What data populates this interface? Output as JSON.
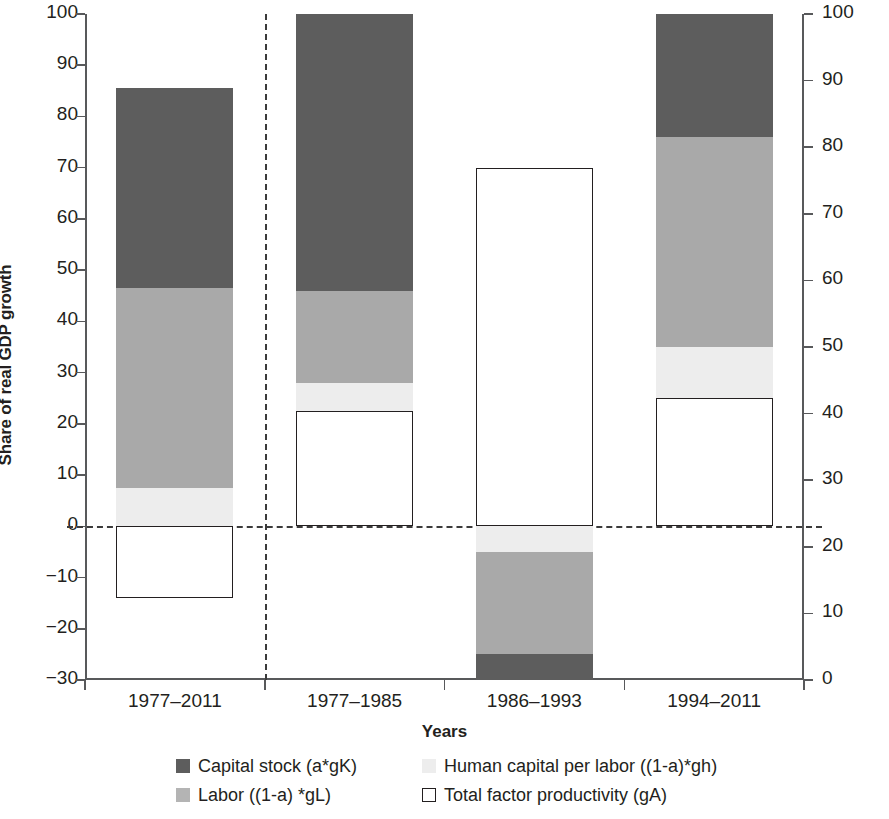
{
  "chart_data": {
    "type": "bar",
    "subtype": "stacked-bar-with-negatives",
    "title": "",
    "xlabel": "Years",
    "ylabel": "Share of real GDP growth",
    "categories": [
      "1977–2011",
      "1977–1985",
      "1986–1993",
      "1994–2011"
    ],
    "series": [
      {
        "name": "Capital stock (a*gK)",
        "color": "#5d5d5d",
        "values": [
          39,
          54,
          -5,
          24
        ]
      },
      {
        "name": "Labor ((1-a) *gL)",
        "color": "#a9a9a9",
        "values": [
          39,
          18,
          -20,
          41
        ]
      },
      {
        "name": "Human capital per labor ((1-a)*gh)",
        "color": "#ededed",
        "values": [
          7.5,
          5.5,
          -5,
          10
        ]
      },
      {
        "name": "Total factor productivity (gA)",
        "color": "#ffffff",
        "values": [
          -14,
          22.5,
          70,
          25
        ]
      }
    ],
    "bar_tops": [
      85.5,
      100,
      70,
      100
    ],
    "ylim": [
      -30,
      100
    ],
    "yticks": [
      -30,
      -20,
      -10,
      0,
      10,
      20,
      30,
      40,
      50,
      60,
      70,
      80,
      90,
      100
    ],
    "ytick_labels": [
      "−30",
      "−20",
      "−10",
      "0",
      "10",
      "20",
      "30",
      "40",
      "50",
      "60",
      "70",
      "80",
      "90",
      "100"
    ],
    "y2lim": [
      0,
      100
    ],
    "y2ticks": [
      0,
      10,
      20,
      30,
      40,
      50,
      60,
      70,
      80,
      90,
      100
    ],
    "y2tick_labels": [
      "0",
      "10",
      "20",
      "30",
      "40",
      "50",
      "60",
      "70",
      "80",
      "90",
      "100"
    ],
    "grid": false,
    "zero_line": true,
    "vertical_separator_after_category": 0,
    "legend_position": "bottom",
    "legend": [
      {
        "label": "Capital stock (a*gK)",
        "swatch": "capital"
      },
      {
        "label": "Human capital per labor ((1-a)*gh)",
        "swatch": "human"
      },
      {
        "label": "Labor ((1-a) *gL)",
        "swatch": "labor"
      },
      {
        "label": "Total factor productivity (gA)",
        "swatch": "tfp"
      }
    ]
  },
  "axes": {
    "y_title": "Share of real GDP growth",
    "x_title": "Years",
    "left_ticks": [
      "100",
      "90",
      "80",
      "70",
      "60",
      "50",
      "40",
      "30",
      "20",
      "10",
      "0",
      "−10",
      "−20",
      "−30"
    ],
    "right_ticks": [
      "100",
      "90",
      "80",
      "70",
      "60",
      "50",
      "40",
      "30",
      "20",
      "10",
      "0"
    ],
    "x_ticks": [
      "1977–2011",
      "1977–1985",
      "1986–1993",
      "1994–2011"
    ]
  },
  "legend_rows": [
    [
      {
        "label": "Capital stock (a*gK)",
        "swatch": "capital"
      },
      {
        "label": "Human capital per labor ((1-a)*gh)",
        "swatch": "human"
      }
    ],
    [
      {
        "label": "Labor ((1-a) *gL)",
        "swatch": "labor"
      },
      {
        "label": "Total factor productivity (gA)",
        "swatch": "tfp"
      }
    ]
  ],
  "colors": {
    "capital_stock": "#5d5d5d",
    "labor": "#a9a9a9",
    "human_capital": "#ededed",
    "tfp_fill": "#ffffff",
    "tfp_stroke": "#231f20",
    "axis": "#58595b",
    "text": "#231f20",
    "background": "#ffffff"
  }
}
